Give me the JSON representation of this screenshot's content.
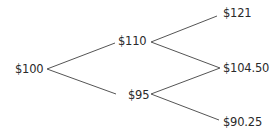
{
  "diagram": {
    "type": "binomial-tree",
    "nodes": {
      "root": {
        "label": "$100"
      },
      "up": {
        "label": "$110"
      },
      "down": {
        "label": "$95"
      },
      "up_up": {
        "label": "$121"
      },
      "up_down": {
        "label": "$104.50"
      },
      "down_down": {
        "label": "$90.25"
      }
    },
    "edges": [
      {
        "from": "$100",
        "to": "$110"
      },
      {
        "from": "$100",
        "to": "$95"
      },
      {
        "from": "$110",
        "to": "$121"
      },
      {
        "from": "$110",
        "to": "$104.50"
      },
      {
        "from": "$95",
        "to": "$104.50"
      },
      {
        "from": "$95",
        "to": "$90.25"
      }
    ],
    "line_color": "#555555",
    "text_color": "#2a2a2a"
  }
}
